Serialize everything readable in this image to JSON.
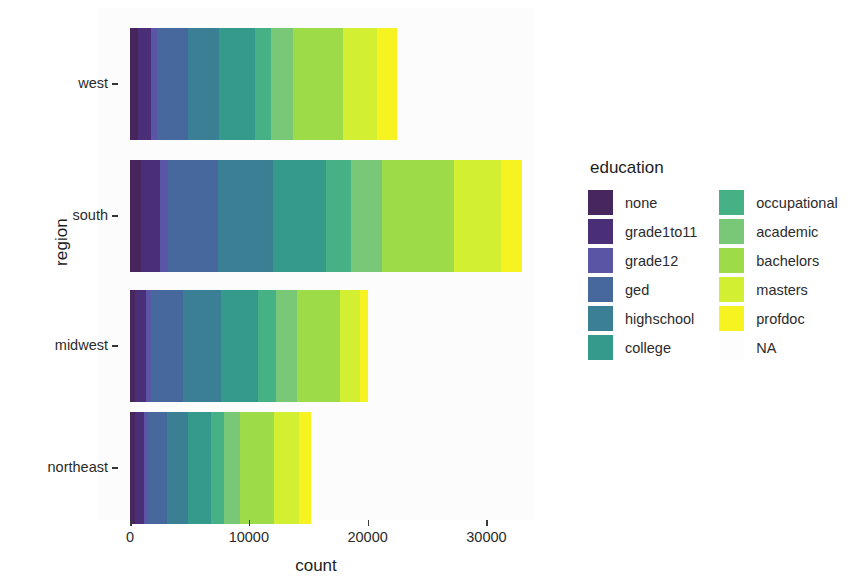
{
  "chart_data": {
    "type": "bar",
    "orientation": "horizontal",
    "stacked": true,
    "title": "",
    "xlabel": "count",
    "ylabel": "region",
    "categories": [
      "west",
      "south",
      "midwest",
      "northeast"
    ],
    "xlim": [
      0,
      34000
    ],
    "xticks": [
      0,
      10000,
      20000,
      30000
    ],
    "xtick_labels": [
      "0",
      "10000",
      "20000",
      "30000"
    ],
    "grid": false,
    "legend_title": "education",
    "legend_position": "right",
    "legend_entries": [
      "none",
      "grade1to11",
      "grade12",
      "ged",
      "highschool",
      "college",
      "occupational",
      "academic",
      "bachelors",
      "masters",
      "profdoc",
      "NA"
    ],
    "colors": {
      "none": "#46265c",
      "grade1to11": "#4b2e78",
      "grade12": "#5a55a5",
      "ged": "#46689c",
      "highschool": "#3b7f95",
      "college": "#349a8b",
      "occupational": "#47b186",
      "academic": "#79c877",
      "bachelors": "#9ddb49",
      "masters": "#d3ef31",
      "profdoc": "#f7f320",
      "NA": "#fdfdfd"
    },
    "series": [
      {
        "name": "none",
        "values": [
          700,
          900,
          450,
          400
        ]
      },
      {
        "name": "grade1to11",
        "values": [
          1100,
          1600,
          900,
          800
        ]
      },
      {
        "name": "grade12",
        "values": [
          500,
          700,
          400,
          350
        ]
      },
      {
        "name": "ged",
        "values": [
          2600,
          4200,
          2700,
          1600
        ]
      },
      {
        "name": "highschool",
        "values": [
          2600,
          4600,
          3200,
          1700
        ]
      },
      {
        "name": "college",
        "values": [
          3000,
          4500,
          3100,
          2000
        ]
      },
      {
        "name": "occupational",
        "values": [
          1400,
          2100,
          1500,
          1100
        ]
      },
      {
        "name": "academic",
        "values": [
          1800,
          2600,
          1800,
          1300
        ]
      },
      {
        "name": "bachelors",
        "values": [
          4200,
          6100,
          3600,
          2900
        ]
      },
      {
        "name": "masters",
        "values": [
          2900,
          3900,
          1700,
          2100
        ]
      },
      {
        "name": "profdoc",
        "values": [
          1700,
          1800,
          650,
          950
        ]
      },
      {
        "name": "NA",
        "values": [
          0,
          0,
          0,
          0
        ]
      }
    ],
    "totals": [
      22500,
      33000,
      20000,
      15200
    ]
  },
  "axes": {
    "y_title": "region",
    "x_title": "count"
  },
  "legend": {
    "title": "education",
    "column_left": [
      {
        "label": "none",
        "color": "#46265c"
      },
      {
        "label": "grade1to11",
        "color": "#4b2e78"
      },
      {
        "label": "grade12",
        "color": "#5a55a5"
      },
      {
        "label": "ged",
        "color": "#46689c"
      },
      {
        "label": "highschool",
        "color": "#3b7f95"
      },
      {
        "label": "college",
        "color": "#349a8b"
      }
    ],
    "column_right": [
      {
        "label": "occupational",
        "color": "#47b186"
      },
      {
        "label": "academic",
        "color": "#79c877"
      },
      {
        "label": "bachelors",
        "color": "#9ddb49"
      },
      {
        "label": "masters",
        "color": "#d3ef31"
      },
      {
        "label": "profdoc",
        "color": "#f7f320"
      },
      {
        "label": "NA",
        "color": "#fdfdfd"
      }
    ]
  }
}
